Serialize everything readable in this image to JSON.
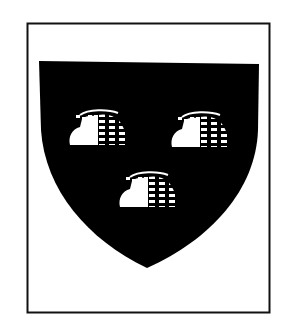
{
  "image": {
    "subject": "heraldic coat of arms",
    "description": "Black shield charged with three beehives, two and one, within a rectangular frame",
    "colors": {
      "background": "#ffffff",
      "frame": "#111111",
      "field": "#000000",
      "charge": "#ffffff"
    },
    "charges": [
      {
        "name": "beehive",
        "position": "dexter chief"
      },
      {
        "name": "beehive",
        "position": "sinister chief"
      },
      {
        "name": "beehive",
        "position": "base"
      }
    ]
  }
}
